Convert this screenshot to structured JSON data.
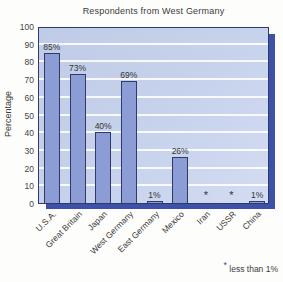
{
  "footnote": {
    "symbol": "*",
    "text": "less than 1%"
  },
  "chart_data": {
    "type": "bar",
    "title": "Respondents from West Germany",
    "xlabel": "",
    "ylabel": "Percentage",
    "ylim": [
      0,
      100
    ],
    "ytick_step": 10,
    "yticks": [
      100,
      90,
      80,
      70,
      60,
      50,
      40,
      30,
      20,
      10,
      0
    ],
    "grid": true,
    "legend": "none",
    "categories": [
      "U.S.A.",
      "Great Britain",
      "Japan",
      "West Germany",
      "East Germany",
      "Mexico",
      "Iran",
      "USSR",
      "China"
    ],
    "values": [
      85,
      73,
      40,
      69,
      1,
      26,
      null,
      null,
      1
    ],
    "value_labels": [
      "85%",
      "73%",
      "40%",
      "69%",
      "1%",
      "26%",
      "*",
      "*",
      "1%"
    ],
    "note": "* less than 1%",
    "colors": {
      "bar_fill": "#8c9cd4",
      "bar_border": "#2b3663",
      "plot_bg": "#c7d2ec",
      "gridline": "#ffffff",
      "shadow": "#3d51a8",
      "plot_border": "#2f3a68",
      "text": "#3a3a3a"
    }
  }
}
